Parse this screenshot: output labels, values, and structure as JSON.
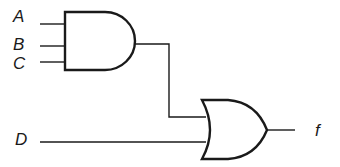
{
  "diagram": {
    "type": "logic-circuit",
    "inputs": [
      {
        "id": "A",
        "label": "A"
      },
      {
        "id": "B",
        "label": "B"
      },
      {
        "id": "C",
        "label": "C"
      },
      {
        "id": "D",
        "label": "D"
      }
    ],
    "output": {
      "id": "f",
      "label": "f"
    },
    "gates": [
      {
        "id": "and1",
        "type": "AND",
        "inputs": [
          "A",
          "B",
          "C"
        ]
      },
      {
        "id": "or1",
        "type": "OR",
        "inputs": [
          "and1",
          "D"
        ],
        "output": "f"
      }
    ],
    "colors": {
      "stroke": "#1a1a1a",
      "background": "#ffffff"
    }
  }
}
